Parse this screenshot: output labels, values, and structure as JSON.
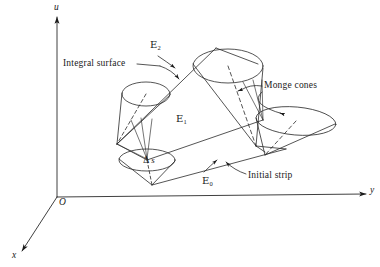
{
  "figure": {
    "type": "diagram",
    "background_color": "#ffffff",
    "line_color": "#1a1a1a",
    "size": {
      "width": 380,
      "height": 267
    }
  },
  "axes": {
    "vertical": {
      "label": "u",
      "x": 57,
      "tip_y": 14,
      "base_y": 197
    },
    "horizontal": {
      "label": "y",
      "tip_x": 370,
      "y": 197
    },
    "depth": {
      "label": "x",
      "tip_x": 18,
      "tip_y": 255
    },
    "origin": {
      "label": "O",
      "x": 57,
      "y": 197
    }
  },
  "strip_labels": [
    {
      "name": "strip-2",
      "base": "E",
      "subscript": "2",
      "x": 152,
      "y": 42
    },
    {
      "name": "strip-1",
      "base": "E",
      "subscript": "1",
      "x": 177,
      "y": 116
    },
    {
      "name": "strip-0",
      "base": "E",
      "subscript": "0",
      "x": 203,
      "y": 177
    }
  ],
  "callouts": [
    {
      "name": "integral-surface",
      "text": "Integral surface",
      "x": 63,
      "y": 61
    },
    {
      "name": "monge-cones",
      "text": "Monge cones",
      "x": 264,
      "y": 82
    },
    {
      "name": "initial-strip",
      "text": "Initial strip",
      "x": 248,
      "y": 172
    }
  ],
  "annotations": [
    {
      "name": "arc-length-increment",
      "delta": "Δ",
      "variable": "s",
      "x": 144,
      "y": 158
    }
  ],
  "cones": [
    {
      "name": "monge-cone-upper-left",
      "apex_x": 117,
      "apex_y": 144,
      "rim_cx": 146,
      "rim_cy": 94,
      "rim_rx": 24,
      "rim_ry": 12
    },
    {
      "name": "monge-cone-upper-right",
      "apex_x": 256,
      "apex_y": 146,
      "rim_cx": 228,
      "rim_cy": 66,
      "rim_rx": 35,
      "rim_ry": 17
    },
    {
      "name": "monge-cone-right",
      "apex_x": 265,
      "apex_y": 155,
      "rim_cx": 295,
      "rim_cy": 120,
      "rim_rx": 40,
      "rim_ry": 14
    },
    {
      "name": "monge-cone-lower-left",
      "apex_x": 152,
      "apex_y": 184,
      "rim_cx": 147,
      "rim_cy": 160,
      "rim_rx": 28,
      "rim_ry": 11
    }
  ]
}
